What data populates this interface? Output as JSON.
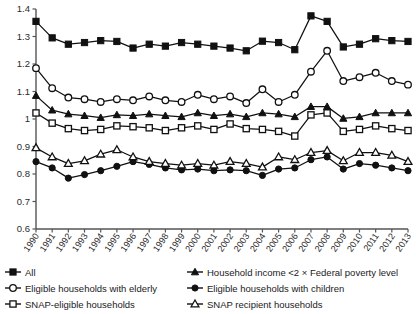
{
  "chart_data": {
    "type": "line",
    "title": "",
    "subtitle": "",
    "xlabel": "",
    "ylabel": "",
    "xlim": [
      1990,
      2013
    ],
    "ylim": [
      0.6,
      1.4
    ],
    "grid": false,
    "legend_position": "bottom",
    "x": [
      1990,
      1991,
      1992,
      1993,
      1994,
      1995,
      1996,
      1997,
      1998,
      1999,
      2000,
      2001,
      2002,
      2003,
      2004,
      2005,
      2006,
      2007,
      2008,
      2009,
      2010,
      2011,
      2012,
      2013
    ],
    "categories": [
      "1990",
      "1991",
      "1992",
      "1993",
      "1994",
      "1995",
      "1996",
      "1997",
      "1998",
      "1999",
      "2000",
      "2001",
      "2002",
      "2003",
      "2004",
      "2005",
      "2006",
      "2007",
      "2008",
      "2009",
      "2010",
      "2011",
      "2012",
      "2013"
    ],
    "ytick_labels": [
      "0.6",
      "0.7",
      "0.8",
      "0.9",
      "1",
      "1.1",
      "1.2",
      "1.3",
      "1.4"
    ],
    "yticks": [
      0.6,
      0.7,
      0.8,
      0.9,
      1.0,
      1.1,
      1.2,
      1.3,
      1.4
    ],
    "series": [
      {
        "name": "All",
        "marker": "filled-square",
        "values": [
          1.355,
          1.295,
          1.272,
          1.278,
          1.285,
          1.282,
          1.258,
          1.272,
          1.265,
          1.278,
          1.272,
          1.265,
          1.258,
          1.248,
          1.283,
          1.278,
          1.252,
          1.375,
          1.355,
          1.262,
          1.272,
          1.292,
          1.285,
          1.282
        ]
      },
      {
        "name": "Eligible households with elderly",
        "marker": "open-circle",
        "values": [
          1.185,
          1.112,
          1.078,
          1.072,
          1.062,
          1.072,
          1.068,
          1.082,
          1.068,
          1.062,
          1.088,
          1.072,
          1.082,
          1.058,
          1.108,
          1.062,
          1.088,
          1.172,
          1.248,
          1.138,
          1.152,
          1.168,
          1.138,
          1.125
        ]
      },
      {
        "name": "SNAP-eligible households",
        "marker": "open-square",
        "values": [
          1.022,
          0.985,
          0.965,
          0.958,
          0.962,
          0.975,
          0.972,
          0.968,
          0.958,
          0.968,
          0.975,
          0.962,
          0.982,
          0.965,
          0.962,
          0.955,
          0.938,
          1.015,
          1.022,
          0.955,
          0.962,
          0.975,
          0.965,
          0.958
        ]
      },
      {
        "name": "Household income <2 × Federal poverty level",
        "marker": "filled-triangle",
        "values": [
          1.085,
          1.032,
          1.018,
          1.012,
          1.005,
          1.015,
          1.012,
          1.018,
          1.012,
          1.008,
          1.022,
          1.012,
          1.018,
          1.008,
          1.022,
          1.018,
          1.008,
          1.045,
          1.045,
          1.002,
          1.008,
          1.022,
          1.022,
          1.022
        ]
      },
      {
        "name": "Eligible households with children",
        "marker": "filled-circle",
        "values": [
          0.845,
          0.822,
          0.785,
          0.798,
          0.812,
          0.828,
          0.845,
          0.835,
          0.822,
          0.815,
          0.818,
          0.812,
          0.815,
          0.812,
          0.795,
          0.818,
          0.822,
          0.852,
          0.862,
          0.818,
          0.838,
          0.832,
          0.822,
          0.812
        ]
      },
      {
        "name": "SNAP recipient households",
        "marker": "open-triangle",
        "values": [
          0.895,
          0.862,
          0.838,
          0.848,
          0.872,
          0.888,
          0.862,
          0.845,
          0.838,
          0.832,
          0.838,
          0.832,
          0.845,
          0.838,
          0.825,
          0.862,
          0.852,
          0.878,
          0.885,
          0.848,
          0.878,
          0.878,
          0.868,
          0.845
        ]
      }
    ]
  },
  "legend": {
    "items": [
      {
        "label": "All",
        "marker": "filled-square"
      },
      {
        "label": "Household income <2 × Federal poverty level",
        "marker": "filled-triangle"
      },
      {
        "label": "Eligible households with elderly",
        "marker": "open-circle"
      },
      {
        "label": "Eligible households with children",
        "marker": "filled-circle"
      },
      {
        "label": "SNAP-eligible households",
        "marker": "open-square"
      },
      {
        "label": "SNAP recipient households",
        "marker": "open-triangle"
      }
    ]
  },
  "style": {
    "line_color": "#111111",
    "axis_color": "#555555",
    "text_color": "#2b2b2b",
    "background": "#ffffff"
  }
}
